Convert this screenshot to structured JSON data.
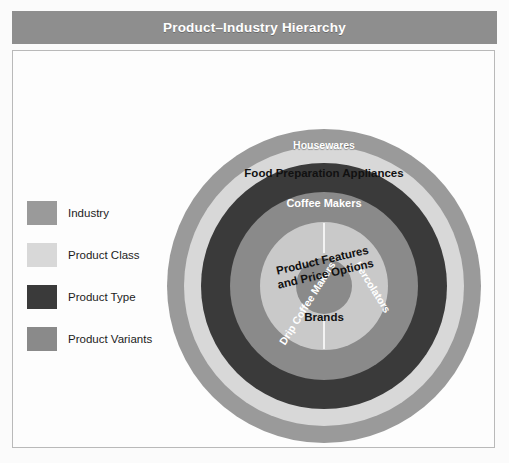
{
  "header": {
    "title": "Product–Industry Hierarchy"
  },
  "colors": {
    "industry": "#9a9a9a",
    "product_class": "#d8d8d8",
    "product_type": "#3a3a3a",
    "product_variants": "#8a8a8a",
    "inner_class": "#c9c9c9",
    "brands": "#8a8a8a",
    "title_bar": "#8e8e8e",
    "panel_border": "#b9b9b9",
    "divider": "#f3f3f3"
  },
  "legend": {
    "items": [
      {
        "label": "Industry",
        "color": "#9a9a9a"
      },
      {
        "label": "Product Class",
        "color": "#d8d8d8"
      },
      {
        "label": "Product Type",
        "color": "#3a3a3a"
      },
      {
        "label": "Product Variants",
        "color": "#8a8a8a"
      }
    ]
  },
  "diagram": {
    "type": "concentric-rings",
    "center": {
      "x": 157,
      "y": 157
    },
    "rings": [
      {
        "name": "Housewares",
        "level": "Industry",
        "radius": 157,
        "color": "#9a9a9a"
      },
      {
        "name": "Food Preparation Appliances",
        "level": "Product Class",
        "radius": 140,
        "color": "#d8d8d8"
      },
      {
        "name": "Coffee Makers",
        "level": "Product Type",
        "radius": 123,
        "color": "#3a3a3a"
      },
      {
        "name": "Drip Coffee Makers",
        "level": "Product Variants",
        "radius": 94,
        "color": "#8a8a8a"
      },
      {
        "name": "Percolators",
        "level": "Product Variants",
        "radius": 94,
        "color": "#8a8a8a"
      },
      {
        "name": "Product Features and Price Options",
        "level": "Product Class",
        "radius": 64,
        "color": "#c9c9c9"
      },
      {
        "name": "Brands",
        "level": "Industry",
        "radius": 28,
        "color": "#8a8a8a"
      }
    ],
    "labels": {
      "housewares": "Housewares",
      "food_prep": "Food Preparation Appliances",
      "coffee_makers": "Coffee Makers",
      "drip": "Drip Coffee Makers",
      "percolators": "Percolators",
      "features_line1": "Product Features",
      "features_line2": "and Price Options",
      "brands": "Brands"
    }
  }
}
